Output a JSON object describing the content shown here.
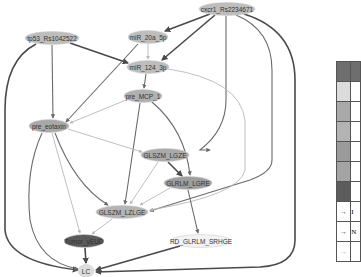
{
  "diagram": {
    "type": "directed-graph",
    "nodes": [
      {
        "id": "cxcr1",
        "label": "cxcr1_Rs2234671",
        "cx": 227,
        "cy": 9,
        "rx": 28,
        "ry": 6.5,
        "fill": "#bdbdbd"
      },
      {
        "id": "tp53",
        "label": "tp53_Rs1042522",
        "cx": 52,
        "cy": 38,
        "rx": 27,
        "ry": 6.5,
        "fill": "#bdbdbd"
      },
      {
        "id": "mir20a",
        "label": "miR_20a_5p",
        "cx": 148,
        "cy": 37,
        "rx": 20,
        "ry": 6.5,
        "fill": "#bdbdbd"
      },
      {
        "id": "mir124",
        "label": "miR_124_3p",
        "cx": 148,
        "cy": 67,
        "rx": 21,
        "ry": 6.5,
        "fill": "#bdbdbd"
      },
      {
        "id": "premcp1",
        "label": "pre_MCP_1",
        "cx": 143,
        "cy": 96,
        "rx": 19,
        "ry": 6.5,
        "fill": "#b0b0b0"
      },
      {
        "id": "preeotaxin",
        "label": "pre_eotaxin",
        "cx": 49,
        "cy": 126,
        "rx": 20,
        "ry": 6.5,
        "fill": "#a8a8a8"
      },
      {
        "id": "glszmlgze",
        "label": "GLSZM_LGZE",
        "cx": 165,
        "cy": 155,
        "rx": 24,
        "ry": 6.5,
        "fill": "#aaaaaa"
      },
      {
        "id": "glrlmlgre",
        "label": "GLRLM_LGRE",
        "cx": 188,
        "cy": 183,
        "rx": 24,
        "ry": 6.5,
        "fill": "#9e9e9e"
      },
      {
        "id": "glszmlzlge",
        "label": "GLSZM_LZLGE",
        "cx": 122,
        "cy": 212,
        "rx": 26,
        "ry": 6.5,
        "fill": "#b4b4b4"
      },
      {
        "id": "tumor",
        "label": "Tumor_yEUD",
        "cx": 84,
        "cy": 241,
        "rx": 20,
        "ry": 6.5,
        "fill": "#5a5a5a"
      },
      {
        "id": "rdglrlm",
        "label": "RD_GLRLM_SRHGE",
        "cx": 201,
        "cy": 241,
        "rx": 30,
        "ry": 6.5,
        "fill": "#f2f2f2"
      },
      {
        "id": "lc",
        "label": "LC",
        "cx": 86,
        "cy": 271,
        "rx": 8,
        "ry": 6.5,
        "fill": "#dddddd"
      }
    ],
    "edges": [
      {
        "from": "cxcr1",
        "to": "mir20a",
        "weight": "strong",
        "d": "M210,14 L165,31"
      },
      {
        "from": "cxcr1",
        "to": "mir124",
        "weight": "strong",
        "d": "M215,15 L162,60"
      },
      {
        "from": "cxcr1",
        "to": "glszmlzlge",
        "weight": "normal",
        "d": "M226,16 L226,100 Q226,130 200,150 L210,150"
      },
      {
        "from": "cxcr1",
        "to": "glszmlzlge",
        "weight": "normal",
        "d": "M236,15 Q272,30 272,70 L272,160 Q272,172 250,180 L150,211"
      },
      {
        "from": "cxcr1",
        "to": "lc",
        "weight": "strong",
        "d": "M244,14 Q295,30 295,80 L295,240 Q295,265 260,267 L96,272"
      },
      {
        "from": "tp53",
        "to": "mir124",
        "weight": "strong",
        "d": "M70,43 L128,63"
      },
      {
        "from": "tp53",
        "to": "preeotaxin",
        "weight": "normal",
        "d": "M52,45 L53,118"
      },
      {
        "from": "tp53",
        "to": "lc",
        "weight": "strong",
        "d": "M36,44 Q5,60 5,110 L5,230 Q8,262 78,270"
      },
      {
        "from": "mir20a",
        "to": "mir124",
        "weight": "weak",
        "d": "M148,44 L148,59"
      },
      {
        "from": "mir20a",
        "to": "preeotaxin",
        "weight": "normal",
        "d": "M138,44 L66,122"
      },
      {
        "from": "mir124",
        "to": "premcp1",
        "weight": "normal",
        "d": "M146,74 L144,88"
      },
      {
        "from": "mir124",
        "to": "glszmlzlge",
        "weight": "weak",
        "d": "M168,69 Q240,80 245,120 L245,170 Q240,195 150,210"
      },
      {
        "from": "premcp1",
        "to": "preeotaxin",
        "weight": "weak",
        "d": "M126,100 L70,123"
      },
      {
        "from": "premcp1",
        "to": "glszmlzlge",
        "weight": "normal",
        "d": "M140,103 L125,204"
      },
      {
        "from": "premcp1",
        "to": "glrlmlgre",
        "weight": "normal",
        "d": "M152,102 Q185,130 190,175"
      },
      {
        "from": "preeotaxin",
        "to": "glszmlgze",
        "weight": "weak",
        "d": "M68,129 L142,152"
      },
      {
        "from": "preeotaxin",
        "to": "glszmlzlge",
        "weight": "normal",
        "d": "M55,133 Q75,185 108,205"
      },
      {
        "from": "preeotaxin",
        "to": "tumor",
        "weight": "weak",
        "d": "M52,133 L80,233"
      },
      {
        "from": "preeotaxin",
        "to": "lc",
        "weight": "normal",
        "d": "M42,133 Q25,170 30,220 Q38,262 78,269"
      },
      {
        "from": "glszmlgze",
        "to": "glrlmlgre",
        "weight": "strong",
        "d": "M168,162 L182,176"
      },
      {
        "from": "glszmlgze",
        "to": "glszmlzlge",
        "weight": "weak",
        "d": "M158,162 L130,204"
      },
      {
        "from": "glrlmlgre",
        "to": "glszmlzlge",
        "weight": "weak",
        "d": "M170,188 L140,205"
      },
      {
        "from": "glrlmlgre",
        "to": "rdglrlm",
        "weight": "normal",
        "d": "M188,190 L198,233"
      },
      {
        "from": "glszmlzlge",
        "to": "tumor",
        "weight": "weak",
        "d": "M112,219 L92,234"
      },
      {
        "from": "tumor",
        "to": "lc",
        "weight": "strong",
        "d": "M85,248 L86,263"
      },
      {
        "from": "rdglrlm",
        "to": "lc",
        "weight": "strong",
        "d": "M180,246 L96,270"
      }
    ],
    "edge_colors": {
      "strong": "#4a4a4a",
      "normal": "#6a6a6a",
      "weak": "#b8b8b8"
    }
  },
  "legend": {
    "header_color": "#6e6e6e",
    "rows": [
      {
        "kind": "swatch",
        "color": "#dcdcdc",
        "label": ""
      },
      {
        "kind": "swatch",
        "color": "#a9a9a9",
        "label": ""
      },
      {
        "kind": "swatch",
        "color": "#b3b3b3",
        "label": ""
      },
      {
        "kind": "swatch",
        "color": "#9b9b9b",
        "label": ""
      },
      {
        "kind": "swatch",
        "color": "#a4a4a4",
        "label": ""
      },
      {
        "kind": "swatch",
        "color": "#5c5c5c",
        "label": ""
      },
      {
        "kind": "arrow",
        "symbol": "→",
        "color": "#444444",
        "label": "I"
      },
      {
        "kind": "arrow",
        "symbol": "→",
        "color": "#444444",
        "label": "N"
      },
      {
        "kind": "arrow",
        "symbol": "→",
        "color": "#aaaaaa",
        "label": ""
      }
    ]
  }
}
